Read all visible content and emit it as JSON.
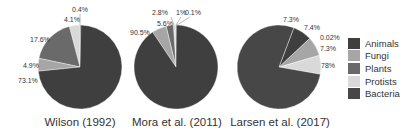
{
  "chart_data": {
    "type": "pie",
    "legend": {
      "position": "right",
      "entries": [
        {
          "name": "Animals",
          "color": "#3f3f3f"
        },
        {
          "name": "Fungi",
          "color": "#a6a6a6"
        },
        {
          "name": "Plants",
          "color": "#6a6a6a"
        },
        {
          "name": "Protists",
          "color": "#d9d9d9"
        },
        {
          "name": "Bacteria",
          "color": "#474747"
        }
      ]
    },
    "charts": [
      {
        "title": "Wilson (1992)",
        "slices": [
          {
            "category": "Animals",
            "value": 73.1,
            "label": "73.1%"
          },
          {
            "category": "Fungi",
            "value": 4.9,
            "label": "4.9%"
          },
          {
            "category": "Plants",
            "value": 17.6,
            "label": "17.6%"
          },
          {
            "category": "Protists",
            "value": 4.1,
            "label": "4.1%"
          },
          {
            "category": "Bacteria",
            "value": 0.4,
            "label": "0.4%"
          }
        ]
      },
      {
        "title": "Mora et al. (2011)",
        "slices": [
          {
            "category": "Animals",
            "value": 90.5,
            "label": "90.5%"
          },
          {
            "category": "Fungi",
            "value": 5.6,
            "label": "5.6%"
          },
          {
            "category": "Plants",
            "value": 2.8,
            "label": "2.8%"
          },
          {
            "category": "Protists",
            "value": 1,
            "label": "1%"
          },
          {
            "category": "Bacteria",
            "value": 0.1,
            "label": "0.1%"
          }
        ]
      },
      {
        "title": "Larsen et al. (2017)",
        "slices": [
          {
            "category": "Animals",
            "value": 7.3,
            "label": "7.3%"
          },
          {
            "category": "Fungi",
            "value": 7.4,
            "label": "7.4%"
          },
          {
            "category": "Plants",
            "value": 0.02,
            "label": "0.02%"
          },
          {
            "category": "Protists",
            "value": 7.3,
            "label": "7.3%"
          },
          {
            "category": "Bacteria",
            "value": 78,
            "label": "78%"
          }
        ]
      }
    ]
  }
}
